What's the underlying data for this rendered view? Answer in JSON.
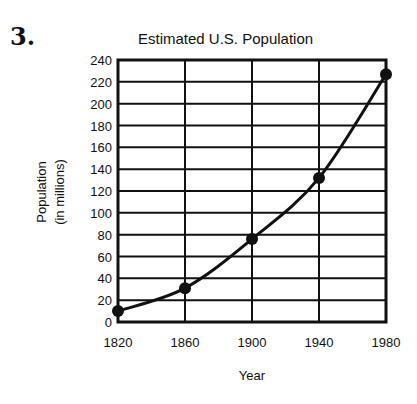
{
  "question_number": "3.",
  "chart_data": {
    "type": "line",
    "title": "Estimated U.S. Population",
    "xlabel": "Year",
    "ylabel": "Population",
    "ylabel_sub": "(in millions)",
    "categories": [
      "1820",
      "1860",
      "1900",
      "1940",
      "1980"
    ],
    "x": [
      1820,
      1860,
      1900,
      1940,
      1980
    ],
    "series": [
      {
        "name": "Estimated U.S. Population",
        "values": [
          10,
          31,
          76,
          132,
          227
        ]
      }
    ],
    "values": [
      10,
      31,
      76,
      132,
      227
    ],
    "yticks": [
      "0",
      "20",
      "40",
      "60",
      "80",
      "100",
      "120",
      "140",
      "160",
      "180",
      "200",
      "220",
      "240"
    ],
    "ylim": [
      0,
      240
    ],
    "xlim": [
      1820,
      1980
    ],
    "grid": true,
    "legend": null,
    "markers": "filled-circle",
    "line_color": "#111111"
  }
}
